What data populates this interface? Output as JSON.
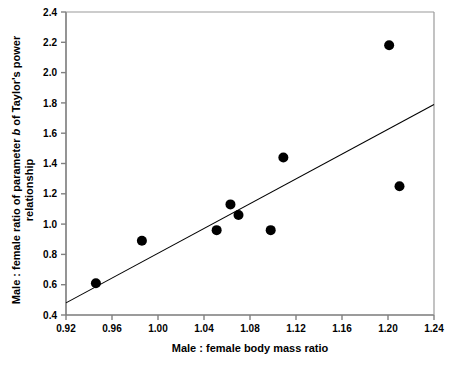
{
  "chart_data": {
    "type": "scatter",
    "title": "",
    "xlabel": "Male : female body mass ratio",
    "ylabel_line1": "Male : female ratio of parameter b of Taylor's power",
    "ylabel_line2": "relationship",
    "ylabel_italic_token": "b",
    "xlim": [
      0.92,
      1.24
    ],
    "ylim": [
      0.4,
      2.4
    ],
    "xticks": [
      "0.92",
      "0.96",
      "1.00",
      "1.04",
      "1.08",
      "1.12",
      "1.16",
      "1.20",
      "1.24"
    ],
    "xtick_values": [
      0.92,
      0.96,
      1.0,
      1.04,
      1.08,
      1.12,
      1.16,
      1.2,
      1.24
    ],
    "yticks": [
      "0.4",
      "0.6",
      "0.8",
      "1.0",
      "1.2",
      "1.4",
      "1.6",
      "1.8",
      "2.0",
      "2.2",
      "2.4"
    ],
    "ytick_values": [
      0.4,
      0.6,
      0.8,
      1.0,
      1.2,
      1.4,
      1.6,
      1.8,
      2.0,
      2.2,
      2.4
    ],
    "grid": false,
    "legend": false,
    "marker_color": "#000000",
    "marker_size": 5,
    "line_color": "#000000",
    "axis_color": "#808080",
    "x": [
      0.946,
      0.986,
      1.051,
      1.063,
      1.07,
      1.098,
      1.109,
      1.201,
      1.21
    ],
    "y": [
      0.61,
      0.89,
      0.96,
      1.13,
      1.06,
      0.96,
      1.44,
      2.18,
      1.25
    ],
    "points": [
      {
        "x": 0.946,
        "y": 0.61
      },
      {
        "x": 0.986,
        "y": 0.89
      },
      {
        "x": 1.051,
        "y": 0.96
      },
      {
        "x": 1.063,
        "y": 1.13
      },
      {
        "x": 1.07,
        "y": 1.06
      },
      {
        "x": 1.098,
        "y": 0.96
      },
      {
        "x": 1.109,
        "y": 1.44
      },
      {
        "x": 1.201,
        "y": 2.18
      },
      {
        "x": 1.21,
        "y": 1.25
      }
    ],
    "trendline": {
      "type": "line",
      "x": [
        0.92,
        1.24
      ],
      "y": [
        0.48,
        1.79
      ]
    }
  }
}
